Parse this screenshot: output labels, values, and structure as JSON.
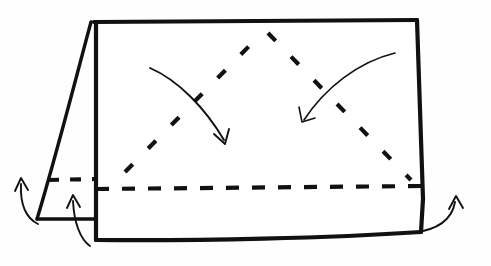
{
  "figure": {
    "type": "line-drawing",
    "background_color": "#fefefe",
    "ink_color": "#111111",
    "width": 491,
    "height": 266
  },
  "shapes": {
    "main_panel": {
      "name": "main-panel",
      "description": "Large quadrilateral sheet, slightly skewed, with curved bottom edge",
      "path": "M 96 22 L 417 20 L 424 200 L 421 232 C 330 238 200 240 96 240 Z"
    },
    "left_flap": {
      "name": "left-flap",
      "description": "Narrow folded-back flap at the left, slanting down-left",
      "outer_edge_path": "M 91 22 C 78 70 55 160 37 219",
      "bottom_edge_path": "M 37 219 L 96 219"
    },
    "main_left_edge": {
      "name": "main-left-edge",
      "path": "M 96 22 L 96 240"
    },
    "main_top_edge": {
      "name": "main-top-edge",
      "path": "M 94 22 L 417 20"
    },
    "main_right_edge": {
      "name": "main-right-edge",
      "path": "M 417 20 L 423 199 L 421 232"
    },
    "main_bottom_edge": {
      "name": "main-bottom-edge",
      "path": "M 96 240 C 200 241 330 238 421 232"
    }
  },
  "fold_lines": {
    "horizontal": {
      "name": "horizontal-fold-line",
      "style": "dashed",
      "path": "M 96 189 L 421 186",
      "dash_pattern": "13 13"
    },
    "left_diagonal": {
      "name": "left-diagonal-fold-line",
      "style": "dashed",
      "path": "M 125 172 L 262 33",
      "dash_pattern": "11 22"
    },
    "right_diagonal": {
      "name": "right-diagonal-fold-line",
      "style": "dashed",
      "path": "M 268 33 L 411 180",
      "dash_pattern": "11 22"
    },
    "flap_horizontal": {
      "name": "flap-fold-line",
      "style": "dashed",
      "path": "M 48 180 L 94 179",
      "dash_pattern": "11 11"
    }
  },
  "arrows": [
    {
      "name": "fold-arrow-left-inward",
      "direction": "down-right",
      "description": "Curved arrow sweeping from upper-left toward the center-bottom",
      "path": "M 150 68 C 178 80 205 108 224 140",
      "head": "M 214 134 L 225 144 L 229 129"
    },
    {
      "name": "fold-arrow-right-inward",
      "direction": "down-left",
      "description": "Curved arrow sweeping from upper-right toward the center-bottom",
      "path": "M 395 53 C 358 62 325 88 304 120",
      "head": "M 299 107 L 302 122 L 315 118"
    },
    {
      "name": "flap-arrow-outer-left",
      "direction": "up",
      "description": "Curved arrow at far left rising past the flap edge",
      "path": "M 38 224 C 26 218 20 206 21 184",
      "head": "M 15 191 L 21 178 L 28 190"
    },
    {
      "name": "flap-arrow-inner-left",
      "direction": "up",
      "description": "Curved arrow rising from below the sheet to the flap area",
      "path": "M 90 246 C 80 239 74 222 73 201",
      "head": "M 67 208 L 73 195 L 80 207"
    },
    {
      "name": "flap-arrow-right",
      "direction": "up",
      "description": "Curved arrow at the bottom-right rising along the right edge",
      "path": "M 412 233 C 438 230 452 220 455 202",
      "head": "M 449 209 L 456 196 L 463 208"
    }
  ]
}
